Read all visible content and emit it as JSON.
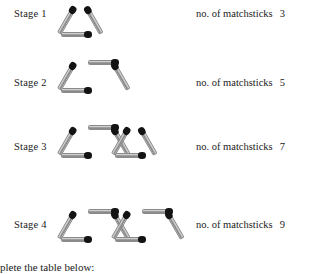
{
  "document": {
    "kind": "matchstick-pattern-worksheet",
    "bottom_instruction": "plete the table below:"
  },
  "colors": {
    "match_head": "#131313",
    "match_body_light": "#d8d8d8",
    "match_body_dark": "#7e7e7e",
    "text": "#1b1b1b",
    "background": "#ffffff"
  },
  "count_label_text": "no. of matchsticks",
  "stages": [
    {
      "label": "Stage 1",
      "count": "3",
      "triangles": 1,
      "matchsticks": 3,
      "label_y": 8,
      "count_y": 8,
      "fig_top": 3,
      "fig_left": 58
    },
    {
      "label": "Stage 2",
      "count": "5",
      "triangles": 2,
      "matchsticks": 5,
      "label_y": 77,
      "count_y": 77,
      "fig_top": 59,
      "fig_left": 58
    },
    {
      "label": "Stage 3",
      "count": "7",
      "triangles": 3,
      "matchsticks": 7,
      "label_y": 141,
      "count_y": 141,
      "fig_top": 124,
      "fig_left": 58
    },
    {
      "label": "Stage 4",
      "count": "9",
      "triangles": 4,
      "matchsticks": 9,
      "label_y": 219,
      "count_y": 219,
      "fig_top": 208,
      "fig_left": 58
    }
  ],
  "layout": {
    "stage_label_x": 14,
    "count_label_x": 196,
    "bottom_text_y": 261
  },
  "chart_data": {
    "type": "table",
    "categories": [
      "Stage 1",
      "Stage 2",
      "Stage 3",
      "Stage 4"
    ],
    "values": [
      3,
      5,
      7,
      9
    ],
    "xlabel": "Stage",
    "ylabel": "no. of matchsticks"
  }
}
